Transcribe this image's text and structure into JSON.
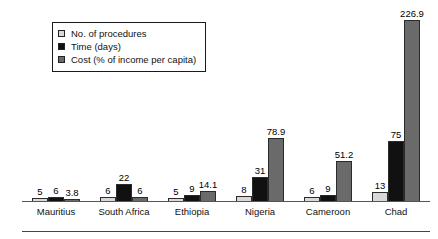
{
  "legend": {
    "position": "top-left",
    "items": [
      {
        "label": "No. of procedures",
        "swatch": "light-gray-swatch",
        "color": "#d8d8d8"
      },
      {
        "label": "Time (days)",
        "swatch": "black-swatch",
        "color": "#111111"
      },
      {
        "label": "Cost (% of income per capita)",
        "swatch": "dark-gray-swatch",
        "color": "#6a6a6a"
      }
    ]
  },
  "chart_data": {
    "type": "bar",
    "title": "",
    "subtitle": "",
    "xlabel": "",
    "ylabel": "",
    "grid": false,
    "legend_position": "top-left",
    "ylim": [
      0,
      240
    ],
    "categories": [
      "Mauritius",
      "South Africa",
      "Ethiopia",
      "Nigeria",
      "Cameroon",
      "Chad"
    ],
    "series": [
      {
        "name": "No. of procedures",
        "color": "#d8d8d8",
        "values": [
          5,
          6,
          5,
          8,
          6,
          13
        ],
        "labels": [
          "5",
          "6",
          "5",
          "8",
          "6",
          "13"
        ]
      },
      {
        "name": "Time (days)",
        "color": "#111111",
        "values": [
          6,
          22,
          9,
          31,
          9,
          75
        ],
        "labels": [
          "6",
          "22",
          "9",
          "31",
          "9",
          "75"
        ]
      },
      {
        "name": "Cost (% of income per capita)",
        "color": "#6a6a6a",
        "values": [
          3.8,
          6,
          14.1,
          78.9,
          51.2,
          226.9
        ],
        "labels": [
          "3.8",
          "6",
          "14.1",
          "78.9",
          "51.2",
          "226.9"
        ]
      }
    ]
  }
}
